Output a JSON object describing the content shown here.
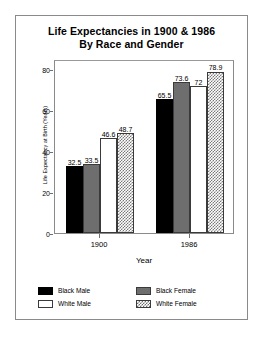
{
  "chart_data": {
    "type": "bar",
    "title": "Life Expectancies in 1900 & 1986 By Race and Gender",
    "title_lines": [
      "Life Expectancies in 1900 & 1986",
      "By Race and Gender"
    ],
    "xlabel": "Year",
    "ylabel": "Life Expectancy at Birth (Years)",
    "categories": [
      "1900",
      "1986"
    ],
    "ylim": [
      0,
      85
    ],
    "yticks": [
      0,
      20,
      40,
      60,
      80
    ],
    "ytick_labels": [
      "0",
      "20",
      "40",
      "60",
      "80"
    ],
    "grid": false,
    "legend_position": "below-plot",
    "series": [
      {
        "name": "Black Male",
        "fill": "solid-black",
        "values": [
          32.5,
          65.5
        ],
        "labels": [
          "32.5",
          "65.5"
        ]
      },
      {
        "name": "Black Female",
        "fill": "gray",
        "values": [
          33.5,
          73.6
        ],
        "labels": [
          "33.5",
          "73.6"
        ]
      },
      {
        "name": "White Male",
        "fill": "white",
        "values": [
          46.6,
          72.0
        ],
        "labels": [
          "46.6",
          "72"
        ]
      },
      {
        "name": "White Female",
        "fill": "hatch",
        "values": [
          48.7,
          78.9
        ],
        "labels": [
          "48.7",
          "78.9"
        ]
      }
    ],
    "legend": [
      {
        "label": "Black Male",
        "fill": "solid-black"
      },
      {
        "label": "Black Female",
        "fill": "gray"
      },
      {
        "label": "White Male",
        "fill": "white"
      },
      {
        "label": "White Female",
        "fill": "hatch"
      }
    ]
  }
}
